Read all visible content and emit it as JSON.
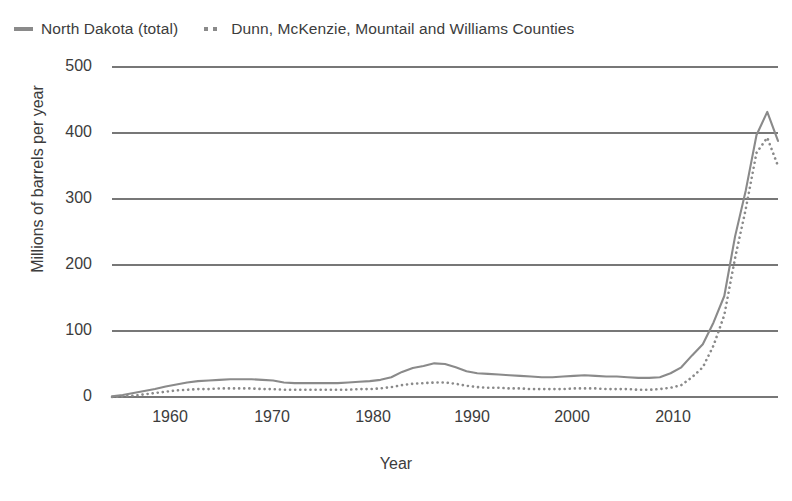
{
  "legend": {
    "position": "top-left",
    "entries": [
      {
        "label": "North Dakota (total)",
        "marker": "solid-line-swatch",
        "color": "#8a8a8a"
      },
      {
        "label": "Dunn, McKenzie, Mountail and Williams Counties",
        "marker": "dotted-line-swatch",
        "color": "#8a8a8a"
      }
    ]
  },
  "axes": {
    "y_label": "Millions of barrels per year",
    "x_label": "Year",
    "y_ticks": [
      "0",
      "100",
      "200",
      "300",
      "400",
      "500"
    ],
    "x_ticks": [
      "1960",
      "1970",
      "1980",
      "1990",
      "2000",
      "2010"
    ]
  },
  "chart_data": {
    "type": "line",
    "title": "",
    "subtitle": "",
    "xlabel": "Year",
    "ylabel": "Millions of barrels per year",
    "xlim": [
      1954,
      2016
    ],
    "ylim": [
      0,
      500
    ],
    "y_ticks": [
      0,
      100,
      200,
      300,
      400,
      500
    ],
    "x_ticks": [
      1960,
      1970,
      1980,
      1990,
      2000,
      2010
    ],
    "grid": "horizontal",
    "legend_position": "top-left",
    "x": [
      1954,
      1955,
      1956,
      1957,
      1958,
      1959,
      1960,
      1961,
      1962,
      1963,
      1964,
      1965,
      1966,
      1967,
      1968,
      1969,
      1970,
      1971,
      1972,
      1973,
      1974,
      1975,
      1976,
      1977,
      1978,
      1979,
      1980,
      1981,
      1982,
      1983,
      1984,
      1985,
      1986,
      1987,
      1988,
      1989,
      1990,
      1991,
      1992,
      1993,
      1994,
      1995,
      1996,
      1997,
      1998,
      1999,
      2000,
      2001,
      2002,
      2003,
      2004,
      2005,
      2006,
      2007,
      2008,
      2009,
      2010,
      2011,
      2012,
      2013,
      2014,
      2015,
      2016
    ],
    "series": [
      {
        "name": "North Dakota (total)",
        "style": "solid",
        "color": "#8a8a8a",
        "values": [
          1,
          3,
          6,
          9,
          12,
          16,
          19,
          22,
          24,
          25,
          26,
          27,
          27,
          27,
          26,
          25,
          22,
          21,
          21,
          21,
          21,
          21,
          22,
          23,
          24,
          26,
          30,
          38,
          44,
          47,
          51,
          50,
          45,
          39,
          36,
          35,
          34,
          33,
          32,
          31,
          30,
          30,
          31,
          32,
          33,
          32,
          31,
          31,
          30,
          29,
          29,
          30,
          36,
          45,
          63,
          80,
          113,
          153,
          243,
          313,
          397,
          432,
          388
        ],
        "notes": "Peaks near 51 in 1984, flat ~30 through the 1990s, steep climb after 2007, maximum 432 in 2015."
      },
      {
        "name": "Dunn, McKenzie, Mountail and Williams Counties",
        "style": "dotted",
        "color": "#8a8a8a",
        "values": [
          0,
          1,
          2,
          4,
          6,
          8,
          10,
          11,
          12,
          12,
          13,
          13,
          13,
          13,
          12,
          12,
          11,
          11,
          11,
          11,
          11,
          11,
          11,
          12,
          12,
          13,
          15,
          18,
          20,
          21,
          22,
          22,
          20,
          17,
          15,
          14,
          14,
          13,
          13,
          12,
          12,
          12,
          12,
          13,
          13,
          13,
          12,
          12,
          12,
          11,
          11,
          12,
          14,
          18,
          30,
          45,
          78,
          124,
          210,
          285,
          370,
          393,
          350
        ],
        "notes": "Tracks the state total at a lower level; maximum 393 in 2015."
      }
    ]
  }
}
